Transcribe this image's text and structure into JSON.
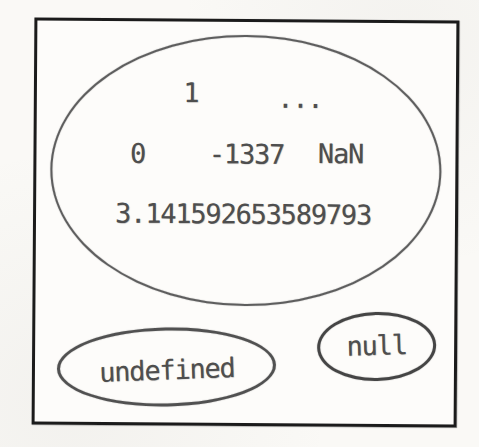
{
  "figure": {
    "number_set": {
      "values": [
        {
          "label": "1"
        },
        {
          "label": "..."
        },
        {
          "label": "0"
        },
        {
          "label": "-1337"
        },
        {
          "label": "NaN"
        },
        {
          "label": "3.141592653589793"
        }
      ]
    },
    "special_values": {
      "undefined_label": "undefined",
      "null_label": "null"
    },
    "colors": {
      "frame_border": "#1b1b1b",
      "number_set_ellipse_stroke": "#5e5e5e",
      "small_ellipse_stroke": "#4c4c4c",
      "text": "#4e4e4e",
      "paper_background": "#faf9f6"
    }
  }
}
